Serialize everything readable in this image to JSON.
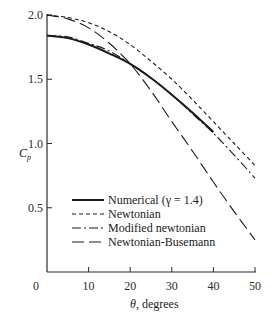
{
  "chart_data": {
    "type": "line",
    "title": "",
    "xlabel": "θ, degrees",
    "ylabel": "C_p",
    "xlim": [
      0,
      50
    ],
    "ylim": [
      0,
      2.0
    ],
    "xticks": [
      0,
      10,
      20,
      30,
      40,
      50
    ],
    "yticks": [
      0.5,
      1.0,
      1.5,
      2.0
    ],
    "xtick_labels": [
      "0",
      "10",
      "20",
      "30",
      "40",
      "50"
    ],
    "ytick_labels": [
      "0.5",
      "1.0",
      "1.5",
      "2.0"
    ],
    "grid": false,
    "legend_position": "lower-left inside",
    "x": [
      0,
      5,
      10,
      15,
      20,
      25,
      30,
      35,
      40,
      45,
      50
    ],
    "series": [
      {
        "name": "Numerical (γ = 1.4)",
        "style": "solid-thick",
        "x": [
          0,
          5,
          10,
          15,
          20,
          25,
          30,
          35,
          40
        ],
        "values": [
          1.84,
          1.82,
          1.77,
          1.7,
          1.62,
          1.51,
          1.38,
          1.24,
          1.09
        ]
      },
      {
        "name": "Newtonian",
        "style": "short-dash",
        "x": [
          0,
          5,
          10,
          15,
          20,
          25,
          30,
          35,
          40,
          45,
          50
        ],
        "values": [
          2.0,
          1.98,
          1.94,
          1.87,
          1.77,
          1.64,
          1.5,
          1.34,
          1.17,
          1.0,
          0.83
        ]
      },
      {
        "name": "Modified newtonian",
        "style": "dash-dot",
        "x": [
          0,
          5,
          10,
          15,
          20,
          25,
          30,
          35,
          40,
          45,
          50
        ],
        "values": [
          1.84,
          1.83,
          1.78,
          1.72,
          1.62,
          1.51,
          1.38,
          1.23,
          1.08,
          0.91,
          0.73
        ]
      },
      {
        "name": "Newtonian-Busemann",
        "style": "long-dash",
        "x": [
          0,
          5,
          10,
          15,
          20,
          25,
          30,
          35,
          40,
          45,
          50
        ],
        "values": [
          2.0,
          1.97,
          1.9,
          1.78,
          1.62,
          1.41,
          1.17,
          0.94,
          0.7,
          0.47,
          0.25
        ]
      }
    ]
  },
  "legend": {
    "items": [
      {
        "label": "Numerical (γ = 1.4)"
      },
      {
        "label": "Newtonian"
      },
      {
        "label": "Modified newtonian"
      },
      {
        "label": "Newtonian-Busemann"
      }
    ]
  },
  "axes": {
    "ylabel_main": "C",
    "ylabel_sub": "p",
    "xlabel_theta": "θ",
    "xlabel_rest": ", degrees",
    "x_zero_label": "0"
  },
  "colors": {
    "ink": "#1a1a1a",
    "background": "#ffffff"
  }
}
